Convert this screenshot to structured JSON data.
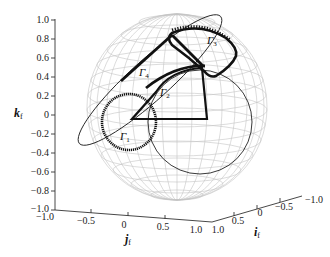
{
  "figure": {
    "type": "3d-unit-sphere-trajectories",
    "axes": {
      "k": {
        "label": "k",
        "subscript": "f",
        "ticks": [
          "1.0",
          "0.8",
          "0.6",
          "0.4",
          "0.2",
          "0",
          "−0.2",
          "−0.4",
          "−0.6",
          "−0.8",
          "−1.0"
        ]
      },
      "j": {
        "label": "j",
        "subscript": "f",
        "ticks": [
          "−1.0",
          "−0.5",
          "0",
          "0.5",
          "1.0"
        ]
      },
      "i": {
        "label": "i",
        "subscript": "f",
        "ticks": [
          "1.0",
          "0.5",
          "0",
          "−0.5",
          "−1.0"
        ]
      }
    },
    "curves": [
      {
        "name": "Gamma1",
        "symbol": "Γ",
        "subscript": "1"
      },
      {
        "name": "Gamma2",
        "symbol": "Γ",
        "subscript": "2"
      },
      {
        "name": "Gamma3",
        "symbol": "Γ",
        "subscript": "3"
      },
      {
        "name": "Gamma4",
        "symbol": "Γ",
        "subscript": "4"
      }
    ],
    "colors": {
      "sphere_grid": "#bdbdbd",
      "curve": "#111111",
      "axis": "#333333"
    }
  }
}
